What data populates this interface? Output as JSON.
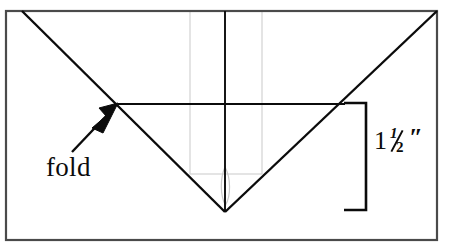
{
  "figure": {
    "background_color": "#ffffff",
    "ink_color": "#0b0b0b",
    "guide_color": "#cfcfcf"
  },
  "annotations": {
    "fold": {
      "label": "fold",
      "icon": "arrow-up-right-icon",
      "points_to": "fold-line-left-end"
    },
    "dimension": {
      "whole": "1",
      "numerator": "1",
      "denominator": "2",
      "unit": "″",
      "full_text": "1½″",
      "icon": "dimension-bracket-icon"
    }
  },
  "geometry": {
    "paper_rect": {
      "x": 6,
      "y": 11,
      "width": 431,
      "height": 229
    },
    "diagonal_left": {
      "x1": 22,
      "y1": 11,
      "x2": 225,
      "y2": 212
    },
    "diagonal_right": {
      "x1": 225,
      "y1": 212,
      "x2": 437,
      "y2": 11
    },
    "fold_line": {
      "x1": 118,
      "y1": 104,
      "x2": 345,
      "y2": 104
    },
    "center_line": {
      "x1": 225,
      "y1": 11,
      "x2": 225,
      "y2": 212
    },
    "guide_rect": {
      "x": 190,
      "y": 11,
      "width": 72,
      "height": 163
    },
    "bracket": {
      "x": 366,
      "y_top": 103,
      "y_bottom": 210,
      "arm": 22
    },
    "arrow": {
      "tail_x": 72,
      "tail_y": 152,
      "tip_x": 118,
      "tip_y": 104
    }
  }
}
